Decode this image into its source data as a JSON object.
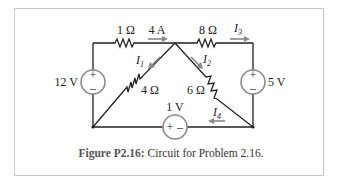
{
  "figure": {
    "caption_label": "Figure P2.16:",
    "caption_text": " Circuit for Problem 2.16."
  },
  "circuit": {
    "sources": [
      {
        "id": "v12",
        "label": "12 V",
        "plus": "+",
        "minus": "–"
      },
      {
        "id": "v5",
        "label": "5 V",
        "plus": "+",
        "minus": "–"
      },
      {
        "id": "v1",
        "label": "1 V",
        "plus": "+",
        "minus": "–"
      }
    ],
    "resistors": [
      {
        "id": "r1",
        "label": "1 Ω"
      },
      {
        "id": "r8",
        "label": "8 Ω"
      },
      {
        "id": "r4",
        "label": "4 Ω"
      },
      {
        "id": "r6",
        "label": "6 Ω"
      }
    ],
    "currents": [
      {
        "id": "i_4A",
        "label": "4 A",
        "sub": ""
      },
      {
        "id": "i1",
        "label": "I",
        "sub": "1"
      },
      {
        "id": "i2",
        "label": "I",
        "sub": "2"
      },
      {
        "id": "i3",
        "label": "I",
        "sub": "3"
      },
      {
        "id": "i4",
        "label": "I",
        "sub": "4"
      }
    ],
    "colors": {
      "wire": "#222222",
      "arrow": "#8a8a8a",
      "source_ring": "#8a8a8a"
    }
  }
}
